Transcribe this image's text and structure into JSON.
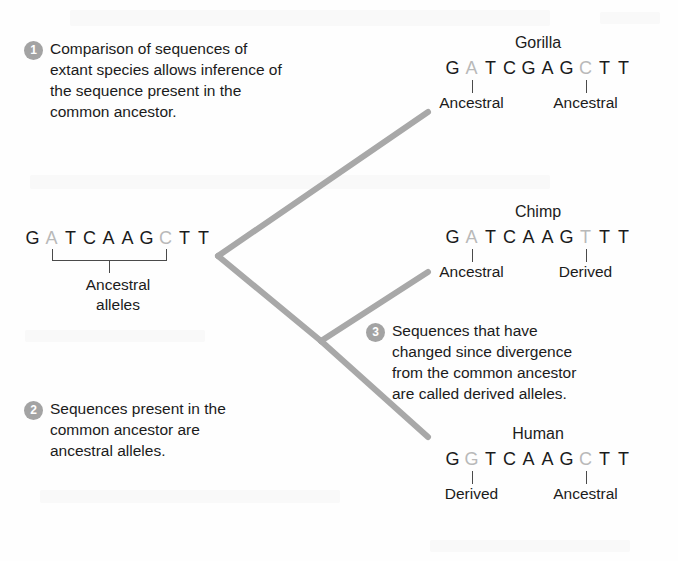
{
  "figure": {
    "background_color": "#fefefe",
    "branch_color": "#a8a8a8",
    "badge_color": "#a3a3a3",
    "highlight_base_color": "#b9b9b9",
    "text_color": "#1b1b1b"
  },
  "callouts": [
    {
      "number": "1",
      "text": "Comparison of sequences of\nextant species allows inference of\nthe sequence present in the\ncommon ancestor."
    },
    {
      "number": "2",
      "text": "Sequences present in the\ncommon ancestor are\nancestral alleles."
    },
    {
      "number": "3",
      "text": "Sequences that have\nchanged since divergence\nfrom the common ancestor\nare called derived alleles."
    }
  ],
  "ancestor": {
    "sequence": [
      "G",
      "A",
      "T",
      "C",
      "A",
      "A",
      "G",
      "C",
      "T",
      "T"
    ],
    "highlight_positions": [
      1,
      7
    ],
    "bracket_label": "Ancestral\nalleles"
  },
  "taxa": [
    {
      "name": "Gorilla",
      "sequence": [
        "G",
        "A",
        "T",
        "C",
        "G",
        "A",
        "G",
        "C",
        "T",
        "T"
      ],
      "highlight_positions": [
        1,
        7
      ],
      "annotations": [
        {
          "position": 1,
          "label": "Ancestral"
        },
        {
          "position": 7,
          "label": "Ancestral"
        }
      ]
    },
    {
      "name": "Chimp",
      "sequence": [
        "G",
        "A",
        "T",
        "C",
        "A",
        "A",
        "G",
        "T",
        "T",
        "T"
      ],
      "highlight_positions": [
        1,
        7
      ],
      "annotations": [
        {
          "position": 1,
          "label": "Ancestral"
        },
        {
          "position": 7,
          "label": "Derived"
        }
      ]
    },
    {
      "name": "Human",
      "sequence": [
        "G",
        "G",
        "T",
        "C",
        "A",
        "A",
        "G",
        "C",
        "T",
        "T"
      ],
      "highlight_positions": [
        1,
        7
      ],
      "annotations": [
        {
          "position": 1,
          "label": "Derived"
        },
        {
          "position": 7,
          "label": "Ancestral"
        }
      ]
    }
  ],
  "tree": {
    "root": {
      "x": 218,
      "y": 256
    },
    "internal_node": {
      "x": 321,
      "y": 341
    },
    "tips": [
      {
        "taxon": "Gorilla",
        "x": 428,
        "y": 112
      },
      {
        "taxon": "Chimp",
        "x": 428,
        "y": 272
      },
      {
        "taxon": "Human",
        "x": 428,
        "y": 437
      }
    ]
  }
}
